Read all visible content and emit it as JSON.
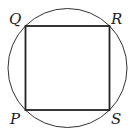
{
  "diagram": {
    "type": "square inscribed in circle",
    "labels": {
      "top_left": "Q",
      "top_right": "R",
      "bottom_left": "P",
      "bottom_right": "S"
    },
    "colors": {
      "stroke": "#222222",
      "background": "#ffffff"
    }
  }
}
